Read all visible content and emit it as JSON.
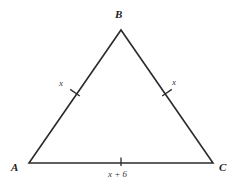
{
  "figure": {
    "type": "triangle-diagram",
    "background_color": "#ffffff",
    "stroke_color": "#2b2b2b",
    "vertices": {
      "a": {
        "label": "A",
        "x": 29,
        "y": 163
      },
      "b": {
        "label": "B",
        "x": 121,
        "y": 30
      },
      "c": {
        "label": "C",
        "x": 213,
        "y": 163
      }
    },
    "sides": [
      {
        "name": "side-ab",
        "label": "x",
        "tick_marks": 1
      },
      {
        "name": "side-bc",
        "label": "x",
        "tick_marks": 1
      },
      {
        "name": "side-ac",
        "label": "x + 6",
        "tick_marks": 1
      }
    ]
  }
}
